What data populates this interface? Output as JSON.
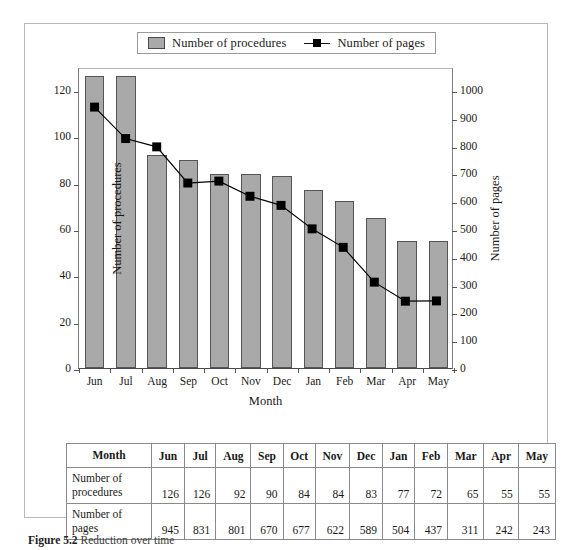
{
  "figure": {
    "caption_label": "Figure 5.2",
    "caption_text": "Reduction over time"
  },
  "legend": {
    "items": [
      {
        "label": "Number of procedures",
        "marker": "bar-swatch-icon",
        "color": "#a9a9a9"
      },
      {
        "label": "Number of pages",
        "marker": "line-square-marker-icon",
        "color": "#000000"
      }
    ]
  },
  "axes": {
    "x_title": "Month",
    "y_left_title": "Number of procedures",
    "y_right_title": "Number of pages",
    "y_left_ticks": [
      0,
      20,
      40,
      60,
      80,
      100,
      120
    ],
    "y_right_ticks": [
      0,
      100,
      200,
      300,
      400,
      500,
      600,
      700,
      800,
      900,
      1000
    ],
    "y_left_range": [
      0,
      130
    ],
    "y_right_range": [
      0,
      1083
    ]
  },
  "chart_data": {
    "type": "bar",
    "title": "",
    "xlabel": "Month",
    "ylabel": "Number of procedures",
    "categories": [
      "Jun",
      "Jul",
      "Aug",
      "Sep",
      "Oct",
      "Nov",
      "Dec",
      "Jan",
      "Feb",
      "Mar",
      "Apr",
      "May"
    ],
    "series": [
      {
        "name": "Number of procedures",
        "type": "bar",
        "axis": "left",
        "color": "#a9a9a9",
        "values": [
          126,
          126,
          92,
          90,
          84,
          84,
          83,
          77,
          72,
          65,
          55,
          55
        ]
      },
      {
        "name": "Number of pages",
        "type": "line",
        "axis": "right",
        "color": "#000000",
        "values": [
          945,
          831,
          801,
          670,
          677,
          622,
          589,
          504,
          437,
          311,
          242,
          243
        ]
      }
    ],
    "ylim": [
      0,
      130
    ],
    "y2lim": [
      0,
      1083
    ],
    "grid": false,
    "legend_position": "top"
  },
  "table": {
    "header": [
      "Month",
      "Jun",
      "Jul",
      "Aug",
      "Sep",
      "Oct",
      "Nov",
      "Dec",
      "Jan",
      "Feb",
      "Mar",
      "Apr",
      "May"
    ],
    "rows": [
      {
        "label": "Number of procedures",
        "values": [
          126,
          126,
          92,
          90,
          84,
          84,
          83,
          77,
          72,
          65,
          55,
          55
        ]
      },
      {
        "label": "Number of pages",
        "values": [
          945,
          831,
          801,
          670,
          677,
          622,
          589,
          504,
          437,
          311,
          242,
          243
        ]
      }
    ]
  }
}
